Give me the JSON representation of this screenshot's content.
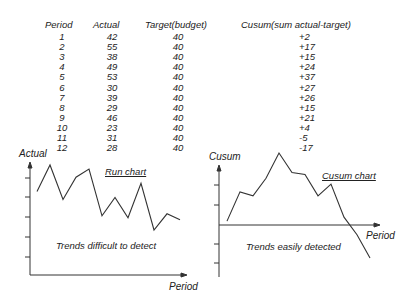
{
  "table": {
    "headers": [
      "Period",
      "Actual",
      "Target(budget)",
      "Cusum(sum  actual-target)"
    ],
    "rows": [
      [
        "1",
        "42",
        "40",
        "+2"
      ],
      [
        "2",
        "55",
        "40",
        "+17"
      ],
      [
        "3",
        "38",
        "40",
        "+15"
      ],
      [
        "4",
        "49",
        "40",
        "+24"
      ],
      [
        "5",
        "53",
        "40",
        "+37"
      ],
      [
        "6",
        "30",
        "40",
        "+27"
      ],
      [
        "7",
        "39",
        "40",
        "+26"
      ],
      [
        "8",
        "29",
        "40",
        "+15"
      ],
      [
        "9",
        "46",
        "40",
        "+21"
      ],
      [
        "10",
        "23",
        "40",
        "+4"
      ],
      [
        "11",
        "31",
        "40",
        "-5"
      ],
      [
        "12",
        "28",
        "40",
        "-17"
      ]
    ]
  },
  "run_chart": {
    "title": "Run chart",
    "ylabel": "Actual",
    "xlabel": "Period",
    "annotation": "Trends difficult to detect"
  },
  "cusum_chart": {
    "title": "Cusum chart",
    "ylabel": "Cusum",
    "xlabel": "Period",
    "annotation": "Trends easily detected"
  },
  "chart_data": [
    {
      "type": "line",
      "title": "Run chart",
      "xlabel": "Period",
      "ylabel": "Actual",
      "x": [
        1,
        2,
        3,
        4,
        5,
        6,
        7,
        8,
        9,
        10,
        11,
        12
      ],
      "series": [
        {
          "name": "Actual",
          "values": [
            42,
            55,
            38,
            49,
            53,
            30,
            39,
            29,
            46,
            23,
            31,
            28
          ]
        }
      ],
      "annotations": [
        "Trends difficult to detect"
      ],
      "grid": false
    },
    {
      "type": "line",
      "title": "Cusum chart",
      "xlabel": "Period",
      "ylabel": "Cusum",
      "x": [
        1,
        2,
        3,
        4,
        5,
        6,
        7,
        8,
        9,
        10,
        11,
        12
      ],
      "series": [
        {
          "name": "Cusum",
          "values": [
            2,
            17,
            15,
            24,
            37,
            27,
            26,
            15,
            21,
            4,
            -5,
            -17
          ]
        }
      ],
      "annotations": [
        "Trends easily detected"
      ],
      "grid": false
    }
  ]
}
